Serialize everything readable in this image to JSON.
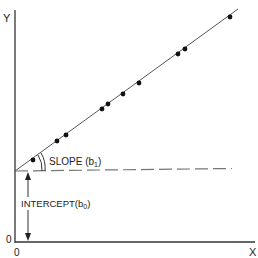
{
  "diagram": {
    "type": "linear-regression-schematic",
    "axes": {
      "y_label": "Y",
      "x_label": "X",
      "y_origin_label": "0",
      "x_origin_label": "0"
    },
    "annotations": {
      "slope_label": "SLOPE (b",
      "slope_subscript": "1",
      "slope_close": ")",
      "intercept_label": "INTERCEPT(b",
      "intercept_subscript": "0",
      "intercept_close": ")"
    },
    "line": {
      "start": [
        15,
        171
      ],
      "end": [
        238,
        9
      ]
    },
    "baseline_dashed": {
      "y": 170,
      "x_start": 15,
      "x_end": 232
    },
    "points": [
      [
        33,
        160
      ],
      [
        57,
        141
      ],
      [
        66,
        135
      ],
      [
        102,
        109
      ],
      [
        108,
        104
      ],
      [
        123,
        94
      ],
      [
        139,
        83
      ],
      [
        178,
        54
      ],
      [
        185,
        49
      ],
      [
        230,
        17
      ]
    ],
    "colors": {
      "ink": "#222222",
      "line": "#555555",
      "dash": "#777777"
    }
  }
}
